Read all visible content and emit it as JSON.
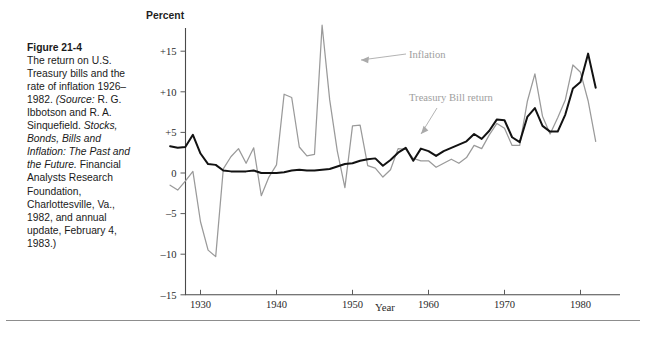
{
  "figure": {
    "number": "Figure 21-4",
    "caption_lines": [
      "The return on",
      "U.S. Treasury",
      "bills and the rate",
      "of inflation",
      "1926–1982."
    ],
    "source_label": "(Source:",
    "source_rest": " R. G.",
    "source_lines": [
      "Ibbotson and R.",
      "A. Sinquefield."
    ],
    "title_italic_lines": [
      "Stocks, Bonds,",
      "Bills and",
      "Inflation: The",
      "Past and the",
      "Future."
    ],
    "publisher_first": " Financial",
    "publisher_lines": [
      "Analysts",
      "Research",
      "Foundation,",
      "Charlottesville,",
      "Va., 1982, and",
      "annual update,",
      "February 4,",
      "1983.)"
    ]
  },
  "chart_data": {
    "type": "line",
    "title": "",
    "xlabel": "Year",
    "ylabel": "Percent",
    "ylim": [
      -15,
      19
    ],
    "xlim": [
      1926,
      1982
    ],
    "yticks": [
      15,
      10,
      5,
      0,
      -5,
      -10,
      -15
    ],
    "ytick_labels": [
      "+15",
      "+10",
      "+5",
      "0",
      "–5",
      "–10",
      "–15"
    ],
    "xticks": [
      1930,
      1940,
      1950,
      1960,
      1970,
      1980
    ],
    "xtick_labels": [
      "1930",
      "1940",
      "1950",
      "1960",
      "1970",
      "1980"
    ],
    "grid": false,
    "legend_position": "inline-annotation",
    "annotations": [
      {
        "text": "Inflation",
        "x": 1954.5,
        "y": 13.0
      },
      {
        "text": "Treasury Bill return",
        "x": 1956.0,
        "y": 9.0
      }
    ],
    "x": [
      1926,
      1927,
      1928,
      1929,
      1930,
      1931,
      1932,
      1933,
      1934,
      1935,
      1936,
      1937,
      1938,
      1939,
      1940,
      1941,
      1942,
      1943,
      1944,
      1945,
      1946,
      1947,
      1948,
      1949,
      1950,
      1951,
      1952,
      1953,
      1954,
      1955,
      1956,
      1957,
      1958,
      1959,
      1960,
      1961,
      1962,
      1963,
      1964,
      1965,
      1966,
      1967,
      1968,
      1969,
      1970,
      1971,
      1972,
      1973,
      1974,
      1975,
      1976,
      1977,
      1978,
      1979,
      1980,
      1981,
      1982
    ],
    "series": [
      {
        "name": "Treasury Bill return",
        "color": "#121212",
        "values": [
          3.3,
          3.1,
          3.2,
          4.7,
          2.4,
          1.1,
          1.0,
          0.3,
          0.2,
          0.2,
          0.2,
          0.3,
          0.0,
          0.0,
          0.0,
          0.1,
          0.3,
          0.4,
          0.3,
          0.3,
          0.4,
          0.5,
          0.8,
          1.1,
          1.2,
          1.5,
          1.7,
          1.8,
          0.9,
          1.6,
          2.5,
          3.1,
          1.5,
          3.0,
          2.7,
          2.1,
          2.7,
          3.1,
          3.5,
          3.9,
          4.8,
          4.2,
          5.2,
          6.6,
          6.5,
          4.4,
          3.8,
          6.9,
          8.0,
          5.8,
          5.1,
          5.1,
          7.2,
          10.4,
          11.2,
          14.7,
          10.5
        ]
      },
      {
        "name": "Inflation",
        "color": "#9a9a9a",
        "values": [
          -1.5,
          -2.1,
          -1.0,
          0.2,
          -6.0,
          -9.5,
          -10.3,
          0.5,
          2.0,
          3.0,
          1.2,
          3.1,
          -2.8,
          -0.5,
          1.0,
          9.7,
          9.3,
          3.2,
          2.1,
          2.3,
          18.2,
          9.0,
          2.7,
          -1.8,
          5.8,
          5.9,
          0.9,
          0.6,
          -0.5,
          0.4,
          3.0,
          2.9,
          1.8,
          1.5,
          1.5,
          0.7,
          1.2,
          1.7,
          1.2,
          1.9,
          3.4,
          3.0,
          4.7,
          6.1,
          5.5,
          3.4,
          3.4,
          8.8,
          12.2,
          7.0,
          4.8,
          6.8,
          9.0,
          13.3,
          12.4,
          8.9,
          3.9
        ]
      }
    ]
  },
  "bottom_rule": true
}
